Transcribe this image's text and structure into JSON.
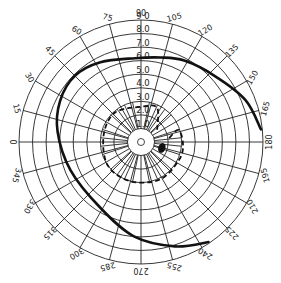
{
  "chart_data": {
    "type": "polar-perimetry",
    "title": "",
    "angle_ticks": [
      0,
      15,
      30,
      45,
      60,
      75,
      90,
      105,
      120,
      135,
      150,
      165,
      180,
      195,
      210,
      225,
      240,
      255,
      270,
      285,
      300,
      315,
      330,
      345
    ],
    "angle_labels": [
      "0",
      "15",
      "30",
      "45",
      "60",
      "75",
      "90",
      "105",
      "120",
      "135",
      "150",
      "165",
      "180",
      "195",
      "210",
      "225",
      "240",
      "255",
      "270",
      "285",
      "300",
      "315",
      "330",
      "345"
    ],
    "eccentricity_rings": [
      10,
      20,
      30,
      40,
      50,
      60,
      70,
      80,
      90
    ],
    "eccentricity_labels": [
      "1.0",
      "2.0",
      "3.0",
      "4.0",
      "5.0",
      "6.0",
      "7.0",
      "8.0",
      "9 0"
    ],
    "eccentricity_range": [
      0,
      90
    ],
    "minor_spokes_inside": 30,
    "series": [
      {
        "name": "outer isopter",
        "style": "solid",
        "points": [
          {
            "angle": 174,
            "ecc": 89
          },
          {
            "angle": 158,
            "ecc": 83
          },
          {
            "angle": 138,
            "ecc": 73
          },
          {
            "angle": 118,
            "ecc": 68
          },
          {
            "angle": 103,
            "ecc": 64
          },
          {
            "angle": 86,
            "ecc": 62
          },
          {
            "angle": 63,
            "ecc": 66
          },
          {
            "angle": 45,
            "ecc": 69
          },
          {
            "angle": 27,
            "ecc": 67
          },
          {
            "angle": 7,
            "ecc": 62
          },
          {
            "angle": 338,
            "ecc": 56
          },
          {
            "angle": 302,
            "ecc": 57
          },
          {
            "angle": 274,
            "ecc": 70
          },
          {
            "angle": 252,
            "ecc": 81
          },
          {
            "angle": 236,
            "ecc": 89
          }
        ]
      },
      {
        "name": "inner isopter",
        "style": "dashed",
        "points": [
          {
            "angle": 143,
            "ecc": 15
          },
          {
            "angle": 115,
            "ecc": 28
          },
          {
            "angle": 90,
            "ecc": 26
          },
          {
            "angle": 48,
            "ecc": 29
          },
          {
            "angle": 10,
            "ecc": 28
          },
          {
            "angle": 325,
            "ecc": 30
          },
          {
            "angle": 285,
            "ecc": 30
          },
          {
            "angle": 243,
            "ecc": 31
          },
          {
            "angle": 205,
            "ecc": 31
          },
          {
            "angle": 183,
            "ecc": 31
          },
          {
            "angle": 162,
            "ecc": 29
          },
          {
            "angle": 175,
            "ecc": 20
          }
        ]
      }
    ],
    "blind_spot": {
      "angle": 196,
      "ecc": 16
    },
    "fixation_ring_ecc": 10
  }
}
